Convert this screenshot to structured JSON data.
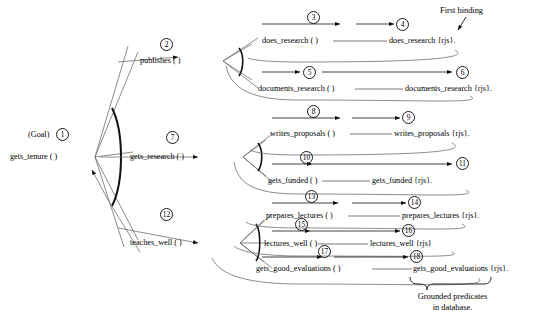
{
  "diagram": {
    "goal": {
      "tag": "(Goal)",
      "number": "1",
      "label": "gets_tenure ( )"
    },
    "annotations": {
      "first_binding": "First binding",
      "grounded_line1": "Grounded predicates",
      "grounded_line2": "in database."
    },
    "branches": [
      {
        "id": "publishes",
        "number": "2",
        "label": "publishes ( )",
        "children": [
          {
            "number_left": "3",
            "label": "does_research ( )",
            "number_right": "4",
            "bound": "does_research {rjs}."
          },
          {
            "number_left": "5",
            "label": "documents_research ( )",
            "number_right": "6",
            "bound": "documents_research {rjs}."
          }
        ]
      },
      {
        "id": "gets_research",
        "number": "7",
        "label": "gets_research ( )",
        "children": [
          {
            "number_left": "8",
            "label": "writes_proposals ( )",
            "number_right": "9",
            "bound": "writes_proposals {rjs}."
          },
          {
            "number_left": "10",
            "label": "gets_funded ( )",
            "number_right": "11",
            "bound": "gets_funded {rjs}."
          }
        ]
      },
      {
        "id": "teaches_well",
        "number": "12",
        "label": "teaches_well ( )",
        "children": [
          {
            "number_left": "13",
            "label": "prepares_lectures ( )",
            "number_right": "14",
            "bound": "prepares_lectures {rjs}."
          },
          {
            "number_left": "15",
            "label": "lectures_well ( )",
            "number_right": "16",
            "bound": "lectures_well {rjs}"
          },
          {
            "number_left": "17",
            "label": "gets_good_evaluations ( )",
            "number_right": "18",
            "bound": "gets_good_evaluations {rjs}."
          }
        ]
      }
    ]
  }
}
